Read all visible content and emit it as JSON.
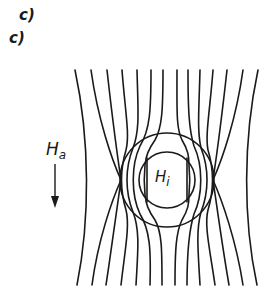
{
  "labels": {
    "panel_label_1": "c)",
    "panel_label_2": "c)",
    "applied_field": {
      "symbol": "H",
      "subscript": "a"
    },
    "internal_field": {
      "symbol": "H",
      "subscript": "i"
    }
  },
  "diagram": {
    "field_direction": "downward",
    "field_line_count": 14,
    "shell": {
      "center": [
        167,
        180
      ],
      "outer_radius": 47,
      "inner_radius": 28
    },
    "colors": {
      "ink": "#1a1a1a",
      "background": "#ffffff"
    }
  }
}
